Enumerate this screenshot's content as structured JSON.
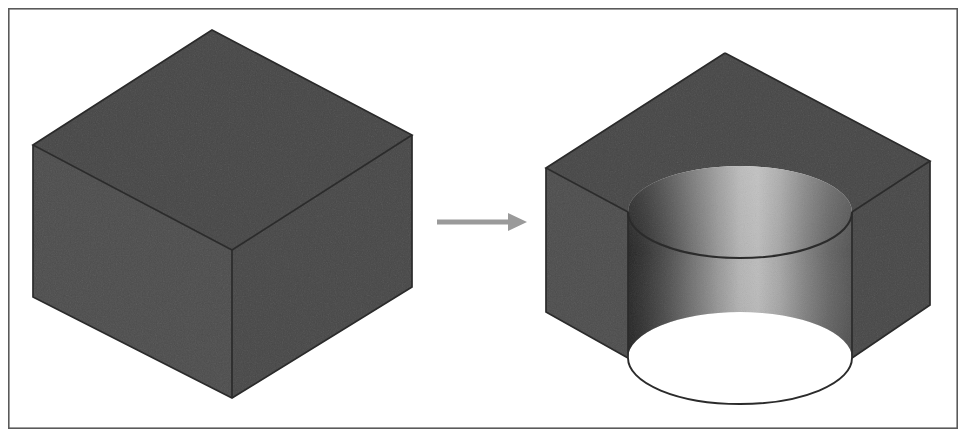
{
  "figure": {
    "canvas": {
      "width": 968,
      "height": 438,
      "background": "#ffffff"
    },
    "frame": {
      "name": "figure-border",
      "x": 8,
      "y": 8,
      "width": 950,
      "height": 421,
      "stroke": "#5a5a5a",
      "stroke_width": 1.6,
      "fill": "none"
    },
    "palette": {
      "top_face": "#8a8a8a",
      "left_face": "#909090",
      "right_face": "#8b8b8b",
      "edge_line": "#2b2b2b",
      "cylinder_dark": "#6e6e6e",
      "cylinder_mid": "#a8a8a8",
      "cylinder_highlight": "#dcdcdc",
      "cylinder_shadow": "#9a9a9a",
      "arrow": "#9a9a9a",
      "background": "#ffffff"
    },
    "objects": [
      {
        "name": "left-block",
        "label": "Unmachined rectangular block",
        "kind": "isometric-box",
        "vertices": {
          "top_back": [
            212,
            30
          ],
          "top_left": [
            33,
            145
          ],
          "top_right": [
            412,
            135
          ],
          "top_front": [
            232,
            250
          ],
          "bottom_left": [
            33,
            297
          ],
          "bottom_right": [
            412,
            287
          ],
          "bottom_front": [
            232,
            398
          ]
        },
        "faces": [
          {
            "name": "top-face",
            "shade": "#8a8a8a"
          },
          {
            "name": "left-front-face",
            "shade": "#909090"
          },
          {
            "name": "right-front-face",
            "shade": "#8b8b8b"
          }
        ]
      },
      {
        "name": "transform-arrow",
        "label": "Process direction arrow",
        "kind": "arrow",
        "direction": "right",
        "shaft": {
          "x1": 437,
          "y1": 222,
          "x2": 512,
          "y2": 222,
          "thickness": 5
        },
        "head": {
          "tip": [
            527,
            222
          ],
          "back": [
            508,
            213
          ],
          "back2": [
            508,
            231
          ]
        },
        "color": "#9a9a9a"
      },
      {
        "name": "right-block",
        "label": "Machined block with cylindrical channel cut through the front corner",
        "kind": "isometric-box-with-cylindrical-cut",
        "vertices": {
          "top_back": [
            725,
            53
          ],
          "top_left": [
            546,
            168
          ],
          "top_right": [
            930,
            161
          ],
          "bottom_left": [
            546,
            312
          ],
          "bottom_right": [
            930,
            305
          ],
          "cut_top_left": [
            628,
            212
          ],
          "cut_top_right": [
            852,
            212
          ],
          "cut_bottom_left": [
            628,
            358
          ],
          "cut_bottom_right": [
            852,
            358
          ],
          "cut_top_apex": [
            740,
            168
          ],
          "cut_bottom_apex": [
            740,
            314
          ]
        },
        "cut": {
          "name": "cylindrical-channel",
          "radius_x": 112,
          "radius_y": 46,
          "depth": 146,
          "shade_left": "#6e6e6e",
          "shade_highlight": "#dcdcdc",
          "shade_right": "#9a9a9a"
        },
        "faces": [
          {
            "name": "top-face",
            "shade": "#8a8a8a"
          },
          {
            "name": "left-front-face",
            "shade": "#909090"
          },
          {
            "name": "right-front-face",
            "shade": "#8b8b8b"
          },
          {
            "name": "cylindrical-cut-face",
            "shade": "gradient"
          }
        ]
      }
    ]
  }
}
